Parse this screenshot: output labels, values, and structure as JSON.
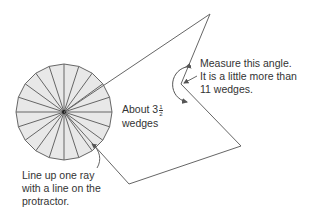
{
  "diagram": {
    "type": "protractor-angle-measurement",
    "colors": {
      "line": "#666666",
      "protractor_fill": "#e8e8e8",
      "text": "#333333",
      "background": "#ffffff"
    },
    "protractor": {
      "center": [
        64,
        112
      ],
      "radius": 48,
      "wedge_count": 20
    },
    "polygon_vertices": [
      [
        64,
        112
      ],
      [
        210,
        14
      ],
      [
        181,
        84
      ],
      [
        241,
        146
      ],
      [
        129,
        184
      ],
      [
        64,
        112
      ]
    ],
    "labels": {
      "measure_line1": "Measure this angle.",
      "measure_line2": "It is a little more than",
      "measure_line3": "11 wedges.",
      "about_prefix": "About 3",
      "about_frac_num": "1",
      "about_frac_den": "2",
      "about_line2": "wedges",
      "lineup_line1": "Line up one ray",
      "lineup_line2": "with a line on the",
      "lineup_line3": "protractor."
    }
  }
}
